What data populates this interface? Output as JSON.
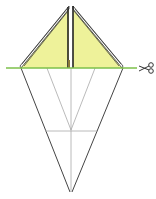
{
  "diagram": {
    "colors": {
      "paper_fill": "#eef29a",
      "paper_edge": "#333333",
      "fold_line": "#9a9a9a",
      "outline": "#444444",
      "cut_line": "#7cc04a",
      "scissors": "#333333",
      "background": "#ffffff"
    },
    "icons": {
      "scissors": "scissors-icon"
    },
    "cut_line_y": 68
  }
}
